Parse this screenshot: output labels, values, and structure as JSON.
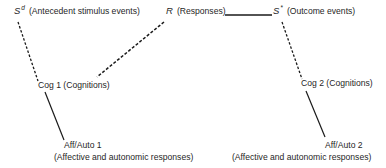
{
  "diagram": {
    "nodes": {
      "sd": {
        "symbol": "S",
        "superscript": "d",
        "label": "(Antecedent stimulus events)"
      },
      "r": {
        "symbol": "R",
        "label": "(Responses)"
      },
      "sstar": {
        "symbol": "S",
        "superscript": "*",
        "label": "(Outcome events)"
      },
      "cog1": {
        "label": "Cog 1 (Cognitions)"
      },
      "cog2": {
        "label": "Cog 2 (Cognitions)"
      },
      "aff1": {
        "title": "Aff/Auto 1",
        "label": "(Affective and autonomic responses)"
      },
      "aff2": {
        "title": "Aff/Auto 2",
        "label": "(Affective and autonomic responses)"
      }
    },
    "edges": [
      {
        "from": "sd",
        "to": "cog1",
        "style": "dashed"
      },
      {
        "from": "r",
        "to": "cog1",
        "style": "dashed"
      },
      {
        "from": "r",
        "to": "sstar",
        "style": "solid"
      },
      {
        "from": "sstar",
        "to": "cog2",
        "style": "dashed"
      },
      {
        "from": "cog1",
        "to": "aff1",
        "style": "solid"
      },
      {
        "from": "cog2",
        "to": "aff2",
        "style": "solid"
      }
    ],
    "colors": {
      "line": "#1a1a1a",
      "text": "#1f1f1f",
      "background": "#ffffff"
    }
  }
}
